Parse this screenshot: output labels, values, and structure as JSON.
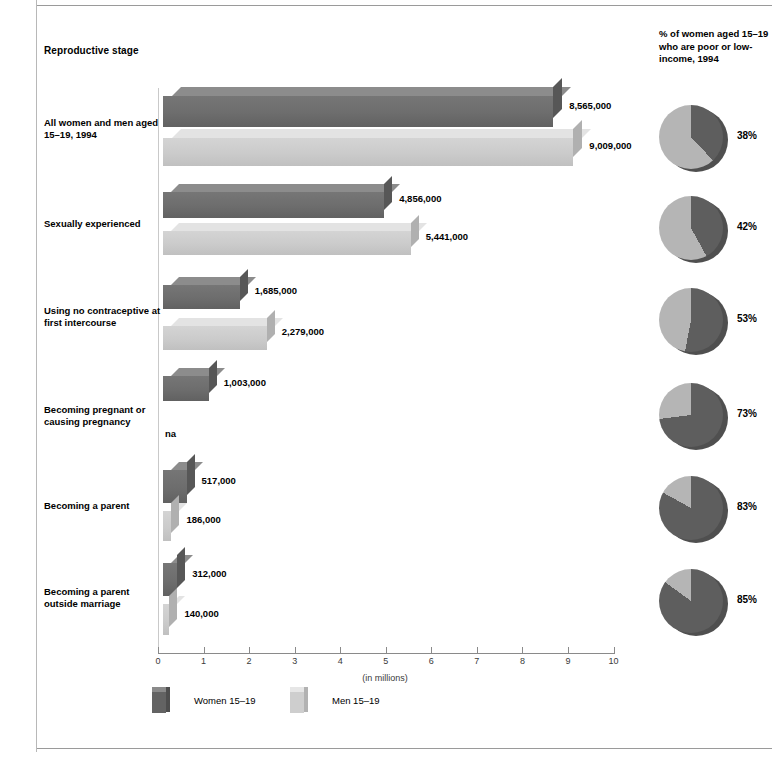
{
  "headers": {
    "stage": "Reproductive stage",
    "pie_column": "% of women aged 15–19 who are poor or low-income, 1994"
  },
  "axis": {
    "caption": "(in millions)",
    "ticks": [
      "0",
      "1",
      "2",
      "3",
      "4",
      "5",
      "6",
      "7",
      "8",
      "9",
      "10"
    ]
  },
  "legend": [
    {
      "label": "Women 15–19",
      "series": "women"
    },
    {
      "label": "Men 15–19",
      "series": "men"
    }
  ],
  "colors": {
    "women_bar": "#6d6d6d",
    "men_bar": "#cbcbcb",
    "pie_dark": "#5e5e5e",
    "pie_light": "#b5b5b5",
    "rule": "#9a9a9a"
  },
  "rows": [
    {
      "label": "All women and men aged 15–19, 1994",
      "women_label": "8,565,000",
      "men_label": "9,009,000",
      "pie_label": "38%"
    },
    {
      "label": "Sexually experienced",
      "women_label": "4,856,000",
      "men_label": "5,441,000",
      "pie_label": "42%"
    },
    {
      "label": "Using no contraceptive at first intercourse",
      "women_label": "1,685,000",
      "men_label": "2,279,000",
      "pie_label": "53%"
    },
    {
      "label": "Becoming pregnant or causing pregnancy",
      "women_label": "1,003,000",
      "men_label": "na",
      "pie_label": "73%"
    },
    {
      "label": "Becoming a parent",
      "women_label": "517,000",
      "men_label": "186,000",
      "pie_label": "83%"
    },
    {
      "label": "Becoming a parent outside marriage",
      "women_label": "312,000",
      "men_label": "140,000",
      "pie_label": "85%"
    }
  ],
  "chart_data": {
    "type": "bar",
    "title": "Reproductive stage",
    "xlabel": "(in millions)",
    "ylabel": "",
    "xlim": [
      0,
      10
    ],
    "grid": false,
    "orientation": "horizontal",
    "legend_position": "bottom-left",
    "categories": [
      "All women and men aged 15–19, 1994",
      "Sexually experienced",
      "Using no contraceptive at first intercourse",
      "Becoming pregnant or causing pregnancy",
      "Becoming a parent",
      "Becoming a parent outside marriage"
    ],
    "series": [
      {
        "name": "Women 15–19",
        "values": [
          8565000,
          4856000,
          1685000,
          1003000,
          517000,
          312000
        ],
        "value_labels": [
          "8,565,000",
          "4,856,000",
          "1,685,000",
          "1,003,000",
          "517,000",
          "312,000"
        ]
      },
      {
        "name": "Men 15–19",
        "values": [
          9009000,
          5441000,
          2279000,
          null,
          186000,
          140000
        ],
        "value_labels": [
          "9,009,000",
          "5,441,000",
          "2,279,000",
          "na",
          "186,000",
          "140,000"
        ]
      }
    ],
    "secondary": {
      "type": "pie",
      "title": "% of women aged 15–19 who are poor or low-income, 1994",
      "categories": [
        "All women and men aged 15–19, 1994",
        "Sexually experienced",
        "Using no contraceptive at first intercourse",
        "Becoming pregnant or causing pregnancy",
        "Becoming a parent",
        "Becoming a parent outside marriage"
      ],
      "values": [
        38,
        42,
        53,
        73,
        83,
        85
      ],
      "value_labels": [
        "38%",
        "42%",
        "53%",
        "73%",
        "83%",
        "85%"
      ],
      "slice_meaning": "dark slice = poor or low-income share"
    }
  }
}
